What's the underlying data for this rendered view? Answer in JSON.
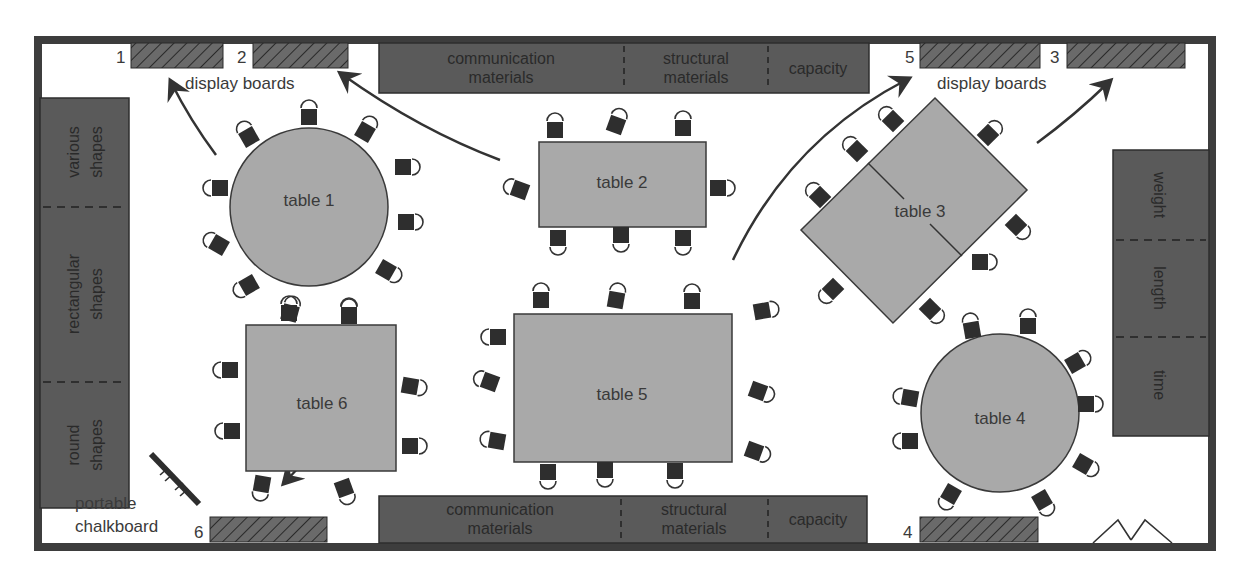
{
  "colors": {
    "wall": "#3d3d3d",
    "shelf": "#5a5a5a",
    "table": "#a9a9a9",
    "chair": "#2e2e2e",
    "board": "#5c5c5c",
    "text": "#3a3a3a"
  },
  "display_boards": {
    "label_top_left": "display boards",
    "label_top_right": "display boards",
    "numbers": {
      "b1": "1",
      "b2": "2",
      "b3": "3",
      "b4": "4",
      "b5": "5",
      "b6": "6"
    }
  },
  "top_shelf": {
    "sections": [
      {
        "line1": "communication",
        "line2": "materials"
      },
      {
        "line1": "structural",
        "line2": "materials"
      },
      {
        "line1": "capacity"
      }
    ]
  },
  "bottom_shelf": {
    "sections": [
      {
        "line1": "communication",
        "line2": "materials"
      },
      {
        "line1": "structural",
        "line2": "materials"
      },
      {
        "line1": "capacity"
      }
    ]
  },
  "left_shelf": {
    "sections": [
      {
        "line1": "various",
        "line2": "shapes"
      },
      {
        "line1": "rectangular",
        "line2": "shapes"
      },
      {
        "line1": "round",
        "line2": "shapes"
      }
    ]
  },
  "right_shelf": {
    "sections": [
      {
        "line1": "weight"
      },
      {
        "line1": "length"
      },
      {
        "line1": "time"
      }
    ]
  },
  "tables": {
    "t1": "table 1",
    "t2": "table 2",
    "t3": "table 3",
    "t4": "table 4",
    "t5": "table 5",
    "t6": "table 6"
  },
  "chalkboard": {
    "line1": "portable",
    "line2": "chalkboard"
  }
}
